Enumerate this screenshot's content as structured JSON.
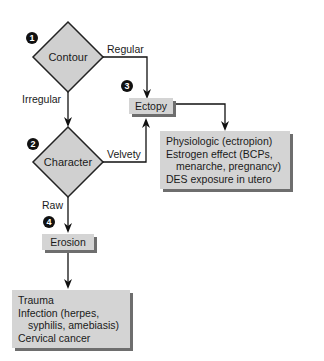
{
  "nodes": {
    "contour": {
      "label": "Contour",
      "step": "1"
    },
    "character": {
      "label": "Character",
      "step": "2"
    },
    "ectopy": {
      "label": "Ectopy",
      "step": "3"
    },
    "erosion": {
      "label": "Erosion",
      "step": "4"
    }
  },
  "edges": {
    "regular": "Regular",
    "irregular": "Irregular",
    "velvety": "Velvety",
    "raw": "Raw"
  },
  "ectopy_causes": [
    "Physiologic (ectropion)",
    "Estrogen effect (BCPs,",
    "menarche, pregnancy)",
    "DES exposure in utero"
  ],
  "erosion_causes": [
    "Trauma",
    "Infection (herpes,",
    "syphilis, amebiasis)",
    "Cervical cancer"
  ],
  "colors": {
    "box_fill": "#d4d4d4",
    "shadow": "#6e6e6e",
    "line": "#111111"
  }
}
